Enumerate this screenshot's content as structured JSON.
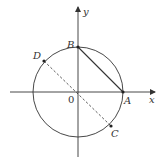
{
  "diagram": {
    "type": "unit-circle-coordinate-figure",
    "axes": {
      "x_label": "x",
      "y_label": "y",
      "origin_label": "0"
    },
    "circle": {
      "center": "0",
      "passes_through": [
        "A",
        "B",
        "C",
        "D"
      ]
    },
    "points": [
      {
        "id": "A",
        "label": "A",
        "position": "positive x-axis intersection"
      },
      {
        "id": "B",
        "label": "B",
        "position": "positive y-axis intersection"
      },
      {
        "id": "C",
        "label": "C",
        "position": "fourth quadrant on circle"
      },
      {
        "id": "D",
        "label": "D",
        "position": "second quadrant on circle"
      }
    ],
    "segments": [
      {
        "from": "A",
        "to": "B",
        "style": "solid"
      },
      {
        "from": "D",
        "to": "C",
        "style": "dashed",
        "through": "0"
      }
    ],
    "colors": {
      "stroke": "#333333",
      "background": "#ffffff"
    }
  }
}
